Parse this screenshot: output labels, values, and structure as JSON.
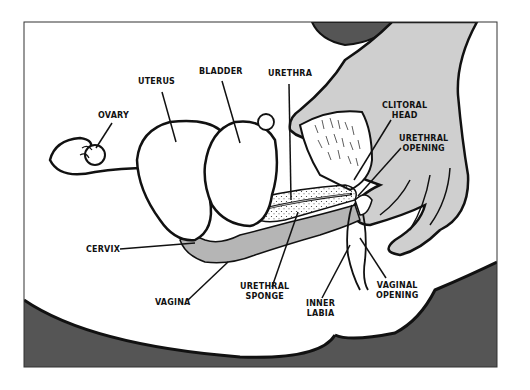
{
  "diagram": {
    "title": "",
    "colors": {
      "background": "#ffffff",
      "frame": "#333333",
      "dark_body": "#555555",
      "hand_fill": "#cfcfcf",
      "vagina_fill": "#b5b5b5",
      "outline": "#111111"
    },
    "labels": [
      {
        "id": "ovary",
        "text": "OVARY"
      },
      {
        "id": "uterus",
        "text": "UTERUS"
      },
      {
        "id": "bladder",
        "text": "BLADDER"
      },
      {
        "id": "urethra",
        "text": "URETHRA"
      },
      {
        "id": "clitoral_head",
        "text": "CLITORAL\nHEAD"
      },
      {
        "id": "urethral_opening",
        "text": "URETHRAL\nOPENING"
      },
      {
        "id": "cervix",
        "text": "CERVIX"
      },
      {
        "id": "vagina",
        "text": "VAGINA"
      },
      {
        "id": "urethral_sponge",
        "text": "URETHRAL\nSPONGE"
      },
      {
        "id": "inner_labia",
        "text": "INNER\nLABIA"
      },
      {
        "id": "vaginal_opening",
        "text": "VAGINAL\nOPENING"
      }
    ]
  }
}
